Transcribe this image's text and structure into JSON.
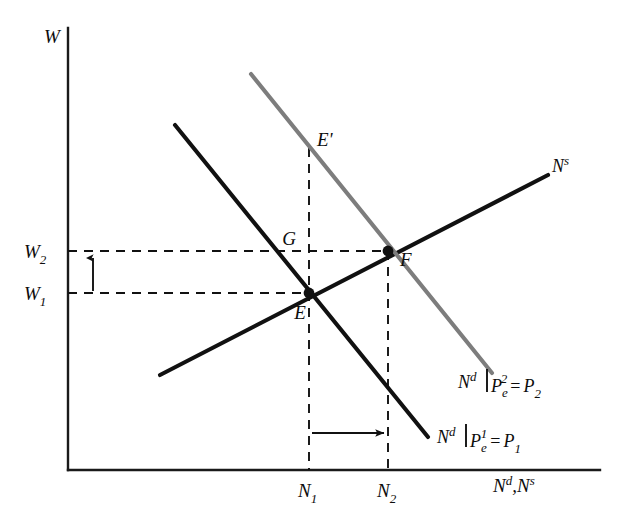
{
  "figure": {
    "type": "economics-line-diagram",
    "title": "",
    "axes": {
      "y_label": "W",
      "x_label_parts": [
        "N",
        "d",
        ",",
        "N",
        "s"
      ],
      "x_label_text": "Nd,Ns",
      "origin": {
        "x": 68,
        "y": 470
      },
      "y_top": 28,
      "x_right": 600
    },
    "colors": {
      "axis": "#1a1a1a",
      "curve_black": "#111111",
      "curve_gray": "#7d7d7d",
      "dashed": "#111111",
      "text": "#0d0d0d",
      "background": "#ffffff"
    },
    "curves": [
      {
        "name": "labour-supply",
        "label_text": "Ns",
        "label_base": "N",
        "label_sup": "s",
        "color": "#111111",
        "x1": 160,
        "y1": 375,
        "x2": 548,
        "y2": 175,
        "label_x": 552,
        "label_y": 172
      },
      {
        "name": "labour-demand-1",
        "label_text": "Nd|Pe1 = P1",
        "label_base": "N",
        "label_sup": "d",
        "label_bar": "|",
        "label_p": "P",
        "label_p_sub": "e",
        "label_p_sup": "1",
        "label_eq": "=",
        "label_rhs": "P",
        "label_rhs_sub": "1",
        "color": "#111111",
        "x1": 175,
        "y1": 125,
        "x2": 428,
        "y2": 437,
        "label_x": 437,
        "label_y": 443
      },
      {
        "name": "labour-demand-2",
        "label_text": "Nd|Pe2 = P2",
        "label_base": "N",
        "label_sup": "d",
        "label_bar": "|",
        "label_p": "P",
        "label_p_sub": "e",
        "label_p_sup": "2",
        "label_eq": "=",
        "label_rhs": "P",
        "label_rhs_sub": "2",
        "color": "#7d7d7d",
        "x1": 251,
        "y1": 74,
        "x2": 492,
        "y2": 373,
        "label_x": 480,
        "label_y": 388
      }
    ],
    "points": [
      {
        "name": "E",
        "label": "E",
        "x": 309,
        "y": 293,
        "dot": true,
        "label_x": 300,
        "label_y": 317
      },
      {
        "name": "F",
        "label": "F",
        "x": 388,
        "y": 251,
        "dot": true,
        "label_x": 400,
        "label_y": 265
      },
      {
        "name": "G",
        "label": "G",
        "x": 309,
        "y": 251,
        "dot": false,
        "label_x": 289,
        "label_y": 245
      },
      {
        "name": "Eprime",
        "label": "E'",
        "x": 309,
        "y": 148,
        "dot": false,
        "label_x": 317,
        "label_y": 145
      }
    ],
    "tick_labels": {
      "y": [
        {
          "name": "W2",
          "base": "W",
          "sub": "2",
          "value_y": 251,
          "label_x": 24,
          "label_y": 258
        },
        {
          "name": "W1",
          "base": "W",
          "sub": "1",
          "value_y": 293,
          "label_x": 24,
          "label_y": 300
        }
      ],
      "x": [
        {
          "name": "N1",
          "base": "N",
          "sub": "1",
          "value_x": 309,
          "label_x": 298,
          "label_y": 497
        },
        {
          "name": "N2",
          "base": "N",
          "sub": "2",
          "value_x": 388,
          "label_x": 377,
          "label_y": 497
        }
      ]
    },
    "guide_lines": [
      {
        "name": "w2-horizontal-dashed",
        "x1": 68,
        "y1": 251,
        "x2": 388,
        "y2": 251
      },
      {
        "name": "w1-horizontal-dashed",
        "x1": 68,
        "y1": 293,
        "x2": 309,
        "y2": 293
      },
      {
        "name": "n1-vertical-dashed",
        "x1": 309,
        "y1": 148,
        "x2": 309,
        "y2": 470
      },
      {
        "name": "n2-vertical-dashed",
        "x1": 388,
        "y1": 251,
        "x2": 388,
        "y2": 470
      }
    ],
    "annotation_arrows": [
      {
        "name": "wage-increase-arrow",
        "direction": "up",
        "x1": 93,
        "y1": 291,
        "x2": 93,
        "y2": 256
      },
      {
        "name": "employment-increase-arrow",
        "direction": "right",
        "x1": 312,
        "y1": 433,
        "x2": 385,
        "y2": 433
      }
    ]
  }
}
